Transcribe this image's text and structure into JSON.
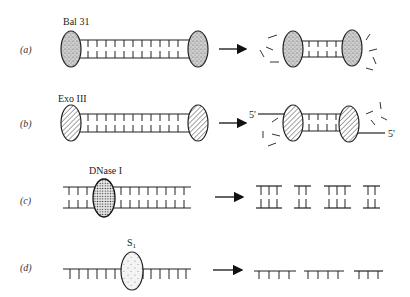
{
  "diagram": {
    "panels": [
      {
        "id": "a",
        "row_label": "(a)",
        "enzyme": "Bal 31",
        "enzyme_fill": "stipple",
        "substrate": "double-stranded DNA",
        "product": "shortened double-stranded DNA with released nucleotides from both ends"
      },
      {
        "id": "b",
        "row_label": "(b)",
        "enzyme": "Exo III",
        "enzyme_fill": "hatched",
        "substrate": "double-stranded DNA",
        "product": "DNA with single-stranded 5' overhangs, released nucleotides",
        "end_label_left": "5'",
        "end_label_right": "5'"
      },
      {
        "id": "c",
        "row_label": "(c)",
        "enzyme": "DNase I",
        "enzyme_fill": "grid-dots",
        "substrate": "double-stranded DNA",
        "product": "double-stranded DNA fragments"
      },
      {
        "id": "d",
        "row_label": "(d)",
        "enzyme": "S",
        "enzyme_subscript": "1",
        "enzyme_fill": "sparse-dots",
        "substrate": "single-stranded DNA",
        "product": "single-stranded DNA fragments"
      }
    ],
    "arrow_icon": "right-arrow"
  }
}
